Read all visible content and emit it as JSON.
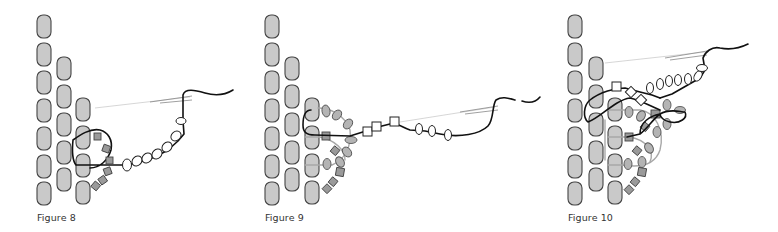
{
  "figures": [
    {
      "id": "fig8",
      "caption": "Figure 8"
    },
    {
      "id": "fig9",
      "caption": "Figure 9"
    },
    {
      "id": "fig10",
      "caption": "Figure 10"
    }
  ],
  "colors": {
    "bead_fill": "#c9c9c9",
    "bead_stroke": "#444444",
    "thread": "#111111",
    "thread_grey": "#a8a8a8",
    "accent_bead_grey": "#9a9a9a"
  }
}
